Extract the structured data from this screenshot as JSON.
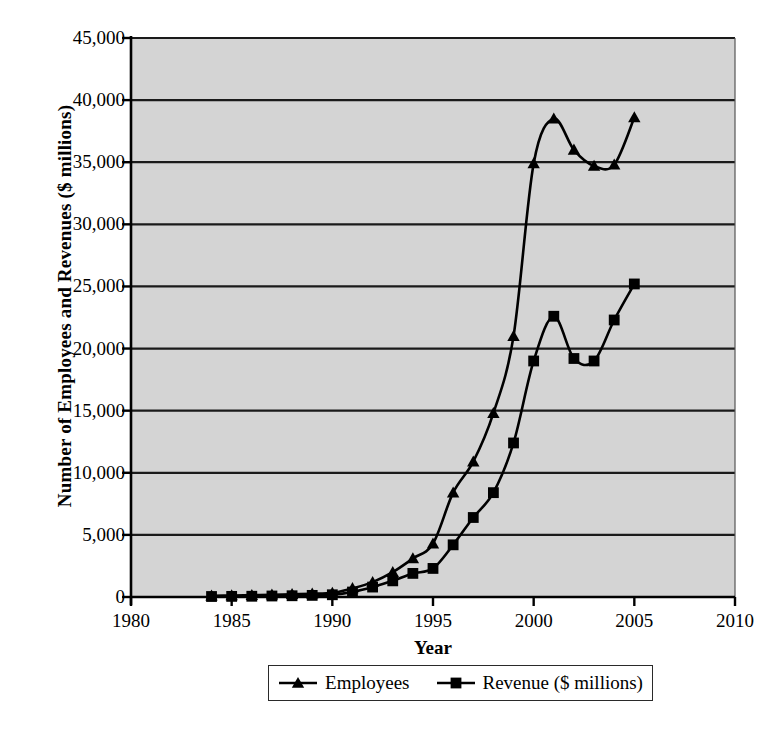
{
  "chart_data": {
    "type": "line",
    "title": "",
    "xlabel": "Year",
    "ylabel": "Number of Employees and Revenues ($ millions)",
    "xlim": [
      1980,
      2010
    ],
    "ylim": [
      0,
      45000
    ],
    "xticks": [
      "1980",
      "1985",
      "1990",
      "1995",
      "2000",
      "2005",
      "2010"
    ],
    "xtick_values": [
      1980,
      1985,
      1990,
      1995,
      2000,
      2005,
      2010
    ],
    "yticks": [
      "0",
      "5,000",
      "10,000",
      "15,000",
      "20,000",
      "25,000",
      "30,000",
      "35,000",
      "40,000",
      "45,000"
    ],
    "ytick_values": [
      0,
      5000,
      10000,
      15000,
      20000,
      25000,
      30000,
      35000,
      40000,
      45000
    ],
    "grid": "horizontal",
    "legend_position": "bottom",
    "plot_background": "#d4d4d4",
    "line_color": "#000000",
    "x": [
      1984,
      1985,
      1986,
      1987,
      1988,
      1989,
      1990,
      1991,
      1992,
      1993,
      1994,
      1995,
      1996,
      1997,
      1998,
      1999,
      2000,
      2001,
      2002,
      2003,
      2004,
      2005
    ],
    "series": [
      {
        "name": "Employees",
        "marker": "triangle",
        "values": [
          100,
          120,
          150,
          180,
          220,
          260,
          330,
          700,
          1200,
          2000,
          3100,
          4300,
          8400,
          10900,
          14800,
          21000,
          34900,
          38500,
          36000,
          34700,
          34800,
          38600
        ]
      },
      {
        "name": "Revenue ($ millions)",
        "marker": "square",
        "values": [
          40,
          50,
          60,
          80,
          100,
          130,
          180,
          400,
          800,
          1300,
          1900,
          2300,
          4200,
          6400,
          8400,
          12400,
          19000,
          22600,
          19200,
          19000,
          22300,
          25200
        ]
      }
    ]
  },
  "legend": {
    "items": [
      {
        "label": "Employees",
        "marker": "triangle"
      },
      {
        "label": "Revenue ($ millions)",
        "marker": "square"
      }
    ]
  }
}
